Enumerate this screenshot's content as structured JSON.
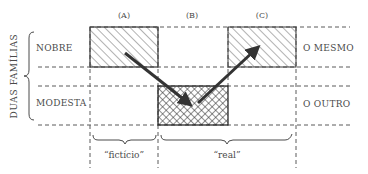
{
  "diagram": {
    "side_label": "DUAS FAMÍLIAS",
    "columns": [
      {
        "id": "A",
        "label": "(A)"
      },
      {
        "id": "B",
        "label": "(B)"
      },
      {
        "id": "C",
        "label": "(C)"
      }
    ],
    "rows": [
      {
        "id": "nobre",
        "label": "NOBRE"
      },
      {
        "id": "modesta",
        "label": "MODESTA"
      }
    ],
    "right_labels": [
      {
        "row": "nobre",
        "label": "O MESMO"
      },
      {
        "row": "modesta",
        "label": "O OUTRO"
      }
    ],
    "bottom_braces": [
      {
        "span": [
          "A"
        ],
        "label": "“fictício”"
      },
      {
        "span": [
          "B",
          "C"
        ],
        "label": "“real”"
      }
    ],
    "boxes": [
      {
        "column": "A",
        "row": "nobre",
        "fill": "diagonal-hatch"
      },
      {
        "column": "B",
        "row": "modesta",
        "fill": "cross-hatch"
      },
      {
        "column": "C",
        "row": "nobre",
        "fill": "diagonal-hatch"
      }
    ],
    "arrows": [
      {
        "from": "A-nobre",
        "to": "B-modesta"
      },
      {
        "from": "B-modesta",
        "to": "C-nobre"
      }
    ],
    "colors": {
      "ink": "#333333",
      "background": "#ffffff"
    }
  }
}
